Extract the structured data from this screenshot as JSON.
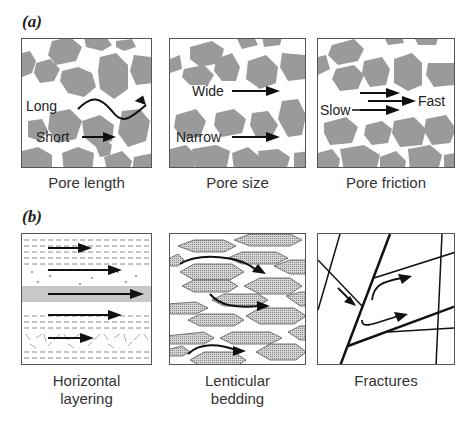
{
  "figure": {
    "panel_a": {
      "label": "(a)",
      "boxes": [
        {
          "caption": "Pore length",
          "labels": {
            "long": "Long",
            "short": "Short"
          }
        },
        {
          "caption": "Pore size",
          "labels": {
            "wide": "Wide",
            "narrow": "Narrow"
          }
        },
        {
          "caption": "Pore friction",
          "labels": {
            "slow": "Slow",
            "fast": "Fast"
          }
        }
      ]
    },
    "panel_b": {
      "label": "(b)",
      "boxes": [
        {
          "caption_line1": "Horizontal",
          "caption_line2": "layering"
        },
        {
          "caption_line1": "Lenticular",
          "caption_line2": "bedding"
        },
        {
          "caption_line1": "Fractures"
        }
      ]
    },
    "colors": {
      "grain": "#9a9a9a",
      "line": "#1a1a1a",
      "border": "#555555",
      "band": "#c8c8c8"
    }
  }
}
